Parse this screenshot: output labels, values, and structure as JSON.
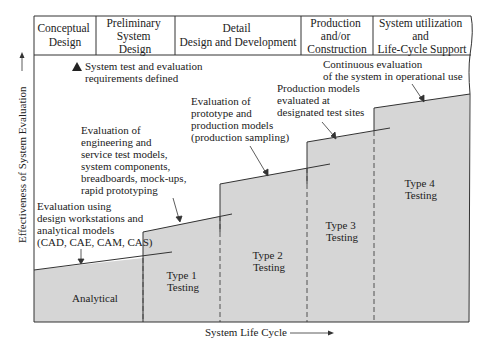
{
  "diagram": {
    "header_phases": [
      {
        "lines": [
          "Conceptual",
          "Design"
        ]
      },
      {
        "lines": [
          "Preliminary",
          "System",
          "Design"
        ]
      },
      {
        "lines": [
          "Detail",
          "Design and Development"
        ]
      },
      {
        "lines": [
          "Production",
          "and/or",
          "Construction"
        ]
      },
      {
        "lines": [
          "System utilization",
          "and",
          "Life-Cycle Support"
        ]
      }
    ],
    "legend": {
      "marker": "triangle-icon",
      "lines": [
        "System test and evaluation",
        "requirements defined"
      ]
    },
    "y_axis_label": "Effectiveness of System Evaluation",
    "x_axis_label": "System Life Cycle",
    "stages": [
      {
        "name": "Analytical",
        "lines": [
          "Analytical"
        ]
      },
      {
        "name": "Type 1 Testing",
        "lines": [
          "Type 1",
          "Testing"
        ]
      },
      {
        "name": "Type 2 Testing",
        "lines": [
          "Type 2",
          "Testing"
        ]
      },
      {
        "name": "Type 3 Testing",
        "lines": [
          "Type 3",
          "Testing"
        ]
      },
      {
        "name": "Type 4 Testing",
        "lines": [
          "Type 4",
          "Testing"
        ]
      }
    ],
    "annotations": [
      {
        "lines": [
          "Evaluation using",
          "design workstations and",
          "analytical models",
          "(CAD, CAE, CAM, CAS)"
        ]
      },
      {
        "lines": [
          "Evaluation of",
          "engineering and",
          "service test models,",
          "system components,",
          "breadboards, mock-ups,",
          "rapid prototyping"
        ]
      },
      {
        "lines": [
          "Evaluation of",
          "prototype and",
          "production models",
          "(production sampling)"
        ]
      },
      {
        "lines": [
          "Production models",
          "evaluated at",
          "designated test sites"
        ]
      },
      {
        "lines": [
          "Continuous evaluation",
          "of the system in operational use"
        ]
      }
    ],
    "colors": {
      "fill": "#d6d6d6",
      "line": "#333333",
      "background": "#ffffff"
    }
  }
}
